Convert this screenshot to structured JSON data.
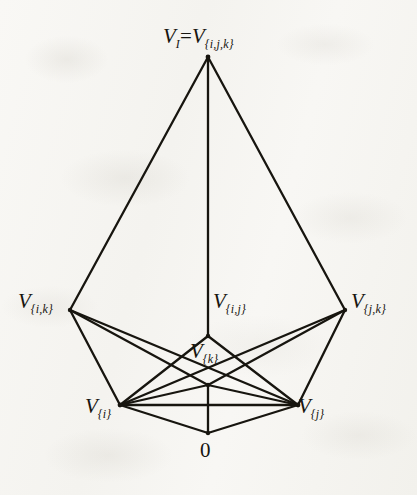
{
  "figure": {
    "type": "hasse-diagram",
    "background_color": "#f7f6f3",
    "line_color": "#17150f",
    "canvas": {
      "width": 417,
      "height": 495
    }
  },
  "nodes": [
    {
      "id": "top",
      "label_v": "V",
      "label_sub_left": "I",
      "equals": "=",
      "label_v2": "V",
      "label_sub": "{i,j,k}",
      "x": 208,
      "y": 57
    },
    {
      "id": "ik",
      "label_v": "V",
      "label_sub": "{i,k}",
      "x": 70,
      "y": 310
    },
    {
      "id": "ij",
      "label_v": "V",
      "label_sub": "{i,j}",
      "x": 208,
      "y": 336
    },
    {
      "id": "jk",
      "label_v": "V",
      "label_sub": "{j,k}",
      "x": 345,
      "y": 310
    },
    {
      "id": "k",
      "label_v": "V",
      "label_sub": "{k}",
      "x": 208,
      "y": 385
    },
    {
      "id": "i",
      "label_v": "V",
      "label_sub": "{i}",
      "x": 120,
      "y": 405
    },
    {
      "id": "j",
      "label_v": "V",
      "label_sub": "{j}",
      "x": 298,
      "y": 405
    },
    {
      "id": "zero",
      "label_v": "0",
      "label_sub": "",
      "x": 208,
      "y": 433
    }
  ],
  "edges": [
    {
      "from": "top",
      "to": "ik"
    },
    {
      "from": "top",
      "to": "ij"
    },
    {
      "from": "top",
      "to": "jk"
    },
    {
      "from": "ik",
      "to": "i"
    },
    {
      "from": "ik",
      "to": "k"
    },
    {
      "from": "ik",
      "to": "j"
    },
    {
      "from": "jk",
      "to": "j"
    },
    {
      "from": "jk",
      "to": "k"
    },
    {
      "from": "jk",
      "to": "i"
    },
    {
      "from": "ij",
      "to": "i"
    },
    {
      "from": "ij",
      "to": "j"
    },
    {
      "from": "k",
      "to": "i"
    },
    {
      "from": "k",
      "to": "j"
    },
    {
      "from": "k",
      "to": "zero"
    },
    {
      "from": "i",
      "to": "j"
    },
    {
      "from": "i",
      "to": "zero"
    },
    {
      "from": "j",
      "to": "zero"
    }
  ],
  "labels": {
    "top": {
      "v": "V",
      "sub_left": "I",
      "eq": "=",
      "v2": "V",
      "sub": "{i,j,k}"
    },
    "ik": {
      "v": "V",
      "sub": "{i,k}"
    },
    "ij": {
      "v": "V",
      "sub": "{i,j}"
    },
    "jk": {
      "v": "V",
      "sub": "{j,k}"
    },
    "k": {
      "v": "V",
      "sub": "{k}"
    },
    "i": {
      "v": "V",
      "sub": "{i}"
    },
    "j": {
      "v": "V",
      "sub": "{j}"
    },
    "zero": {
      "text": "0"
    }
  }
}
